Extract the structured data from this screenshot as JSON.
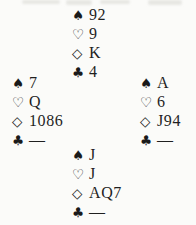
{
  "diagram_type": "bridge-deal",
  "suits": {
    "spade": "♠",
    "heart": "♡",
    "diamond": "◇",
    "club": "♣"
  },
  "void_marker": "—",
  "hands": {
    "north": {
      "spades": "92",
      "hearts": "9",
      "diamonds": "K",
      "clubs": "4"
    },
    "west": {
      "spades": "7",
      "hearts": "Q",
      "diamonds": "1086",
      "clubs": "—"
    },
    "east": {
      "spades": "A",
      "hearts": "6",
      "diamonds": "J94",
      "clubs": "—"
    },
    "south": {
      "spades": "J",
      "hearts": "J",
      "diamonds": "AQ7",
      "clubs": "—"
    }
  },
  "colors": {
    "text": "#1f1f1f",
    "background": "#fbfbf9"
  }
}
